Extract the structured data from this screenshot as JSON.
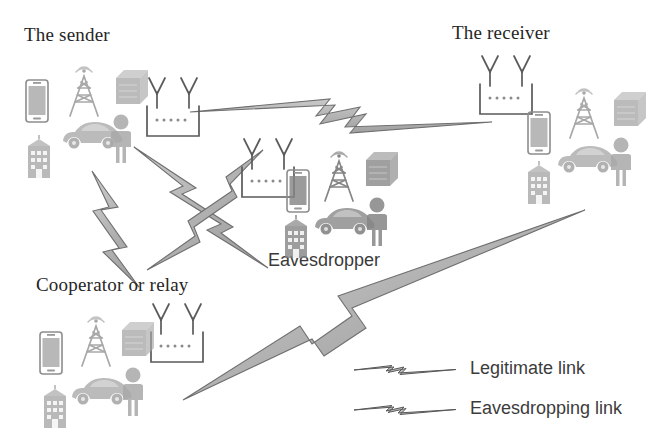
{
  "figure": {
    "type": "wireless-network-security-diagram",
    "background": "#ffffff",
    "ink": "#4a4a4a"
  },
  "nodes": [
    {
      "id": "sender",
      "label": "The sender",
      "label_font": "serif",
      "role": "transmitter"
    },
    {
      "id": "receiver",
      "label": "The receiver",
      "label_font": "serif",
      "role": "legitimate-destination"
    },
    {
      "id": "cooperator",
      "label": "Cooperator or relay",
      "label_font": "serif",
      "role": "relay"
    },
    {
      "id": "eavesdropper",
      "label": "Eavesdropper",
      "label_font": "sans-serif",
      "role": "adversary"
    }
  ],
  "legend": {
    "items": [
      {
        "label": "Legitimate link",
        "symbol": "lightning-bolt-arrow",
        "color": "#9a9a9a"
      },
      {
        "label": "Eavesdropping link",
        "symbol": "lightning-bolt-arrow",
        "color": "#8f8f8f"
      }
    ]
  },
  "icons": {
    "base_station": "base-station-antenna-icon",
    "smartphone": "smartphone-icon",
    "cell_tower": "cell-tower-icon",
    "server": "server-box-icon",
    "building": "office-building-icon",
    "car": "car-icon",
    "person": "person-icon",
    "bolt": "lightning-bolt-icon"
  },
  "links": [
    {
      "from": "sender",
      "to": "receiver",
      "kind": "legitimate"
    },
    {
      "from": "sender",
      "to": "eavesdropper",
      "kind": "eavesdropping"
    },
    {
      "from": "sender",
      "to": "cooperator",
      "kind": "legitimate"
    },
    {
      "from": "cooperator",
      "to": "eavesdropper",
      "kind": "eavesdropping"
    },
    {
      "from": "cooperator",
      "to": "receiver",
      "kind": "legitimate"
    },
    {
      "from": "eavesdropper",
      "to": "receiver",
      "kind": "eavesdropping"
    }
  ]
}
